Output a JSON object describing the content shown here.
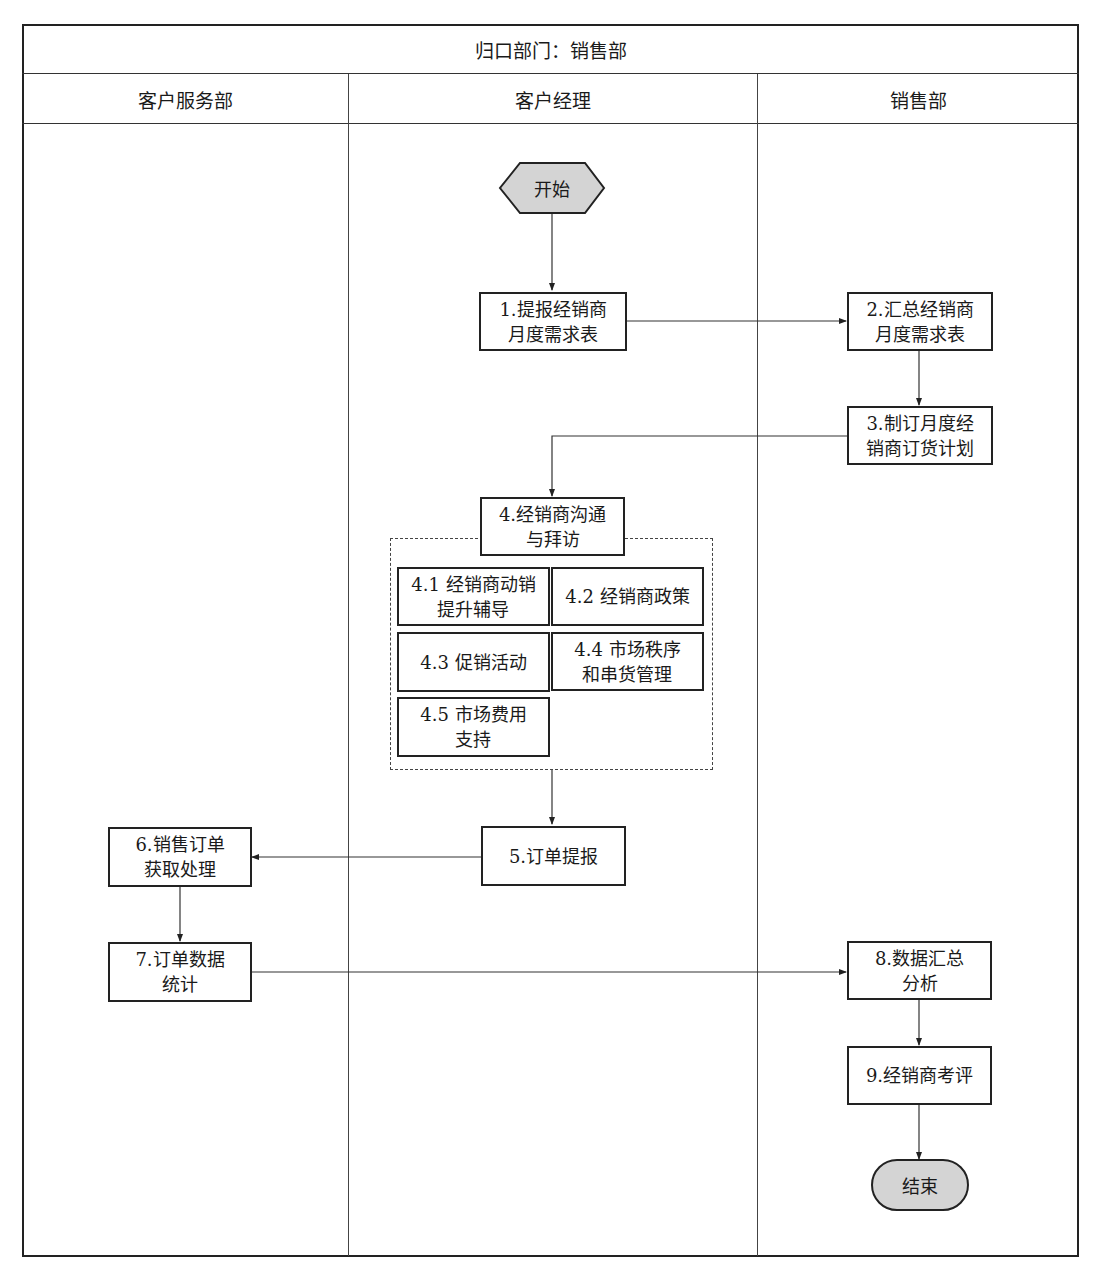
{
  "header": {
    "title": "归口部门：销售部"
  },
  "lanes": [
    {
      "label": "客户服务部"
    },
    {
      "label": "客户经理"
    },
    {
      "label": "销售部"
    }
  ],
  "nodes": {
    "start": "开始",
    "n1": "1.提报经销商\n月度需求表",
    "n2": "2.汇总经销商\n月度需求表",
    "n3": "3.制订月度经\n销商订货计划",
    "n4": "4.经销商沟通\n与拜访",
    "n4_1": "4.1 经销商动销\n提升辅导",
    "n4_2": "4.2 经销商政策",
    "n4_3": "4.3 促销活动",
    "n4_4": "4.4 市场秩序\n和串货管理",
    "n4_5": "4.5 市场费用\n支持",
    "n5": "5.订单提报",
    "n6": "6.销售订单\n获取处理",
    "n7": "7.订单数据\n统计",
    "n8": "8.数据汇总\n分析",
    "n9": "9.经销商考评",
    "end": "结束"
  },
  "edges": [
    [
      "start",
      "n1"
    ],
    [
      "n1",
      "n2"
    ],
    [
      "n2",
      "n3"
    ],
    [
      "n3",
      "n4"
    ],
    [
      "n4",
      "n5"
    ],
    [
      "n5",
      "n6"
    ],
    [
      "n6",
      "n7"
    ],
    [
      "n7",
      "n8"
    ],
    [
      "n8",
      "n9"
    ],
    [
      "n9",
      "end"
    ]
  ],
  "colors": {
    "terminal_fill": "#d4d4d4",
    "line": "#222222"
  }
}
